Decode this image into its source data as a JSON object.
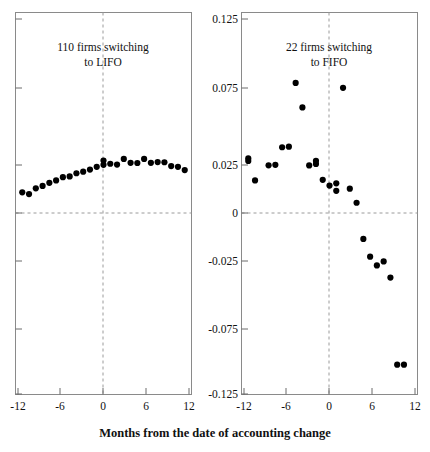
{
  "figure": {
    "caption": "Months from the date of accounting change",
    "background": "#ffffff",
    "point_color": "#000000",
    "axis_color": "#8a8a8a"
  },
  "chart_data": [
    {
      "type": "scatter",
      "panel": "left",
      "title": "110 firms switching to LIFO",
      "title_line1": "110 firms switching",
      "title_line2": "to LIFO",
      "xlabel": "Months from the date of accounting change",
      "ylabel": "",
      "xlim": [
        -13,
        13
      ],
      "ylim": [
        -0.125,
        0.125
      ],
      "xticks": [
        -12,
        -6,
        0,
        6,
        12
      ],
      "xticklabels": [
        "-12",
        "-6",
        "0",
        "6",
        "12"
      ],
      "yticks": [
        0.125,
        0.075,
        0.025,
        0,
        -0.025,
        -0.075,
        -0.125
      ],
      "yticklabels": [
        "0.125",
        "0.075",
        "0.025",
        "0",
        "-0.025",
        "-0.075",
        "-0.125"
      ],
      "grid": false,
      "reference_lines": {
        "vertical_x": 0,
        "horizontal_y": 0,
        "style": "dashed"
      },
      "x": [
        -12,
        -11,
        -10,
        -9,
        -8,
        -7,
        -6,
        -5,
        -4,
        -3,
        -2,
        -1,
        0,
        0,
        1,
        2,
        3,
        4,
        5,
        6,
        7,
        8,
        9,
        10,
        11,
        12
      ],
      "y": [
        0.0073,
        0.0062,
        0.0099,
        0.0115,
        0.0135,
        0.0151,
        0.0172,
        0.0177,
        0.0198,
        0.0208,
        0.0222,
        0.024,
        0.0281,
        0.0253,
        0.026,
        0.0255,
        0.0292,
        0.0266,
        0.0265,
        0.0292,
        0.0266,
        0.0271,
        0.027,
        0.0245,
        0.024,
        0.0219
      ]
    },
    {
      "type": "scatter",
      "panel": "right",
      "title": "22 firms switching to FIFO",
      "title_line1": "22 firms switching",
      "title_line2": "to FIFO",
      "xlabel": "Months from the date of accounting change",
      "ylabel": "",
      "xlim": [
        -13,
        13
      ],
      "ylim": [
        -0.125,
        0.125
      ],
      "xticks": [
        -12,
        -6,
        0,
        6,
        12
      ],
      "xticklabels": [
        "-12",
        "-6",
        "0",
        "6",
        "12"
      ],
      "yticks": [
        0.125,
        0.075,
        0.025,
        0,
        -0.025,
        -0.075,
        -0.125
      ],
      "yticklabels": [
        "0.125",
        "0.075",
        "0.025",
        "0",
        "-0.025",
        "-0.075",
        "-0.125"
      ],
      "grid": false,
      "reference_lines": {
        "vertical_x": 0,
        "horizontal_y": 0,
        "style": "dashed"
      },
      "x": [
        -12,
        -12,
        -11,
        -9,
        -8,
        -7,
        -6,
        -5,
        -4,
        -3,
        -2,
        -2,
        -1,
        0,
        1,
        1,
        2,
        3,
        4,
        5,
        6,
        7,
        8,
        9,
        10,
        11
      ],
      "y": [
        0.0295,
        0.0278,
        0.0151,
        0.025,
        0.0253,
        0.0368,
        0.0372,
        0.0789,
        0.0629,
        0.0249,
        0.0279,
        0.0259,
        0.0155,
        0.0117,
        0.0132,
        0.0083,
        0.0757,
        0.0097,
        0.0005,
        -0.0232,
        -0.0348,
        -0.0405,
        -0.0379,
        -0.0485,
        -0.1055,
        -0.1055
      ]
    }
  ]
}
